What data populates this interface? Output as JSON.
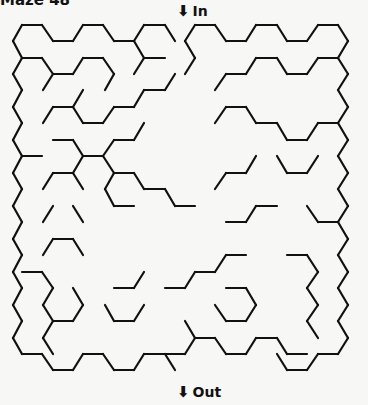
{
  "title": "Maze 48",
  "entrance": {
    "arrow": "⬇",
    "label": "In"
  },
  "exit": {
    "arrow": "⬇",
    "label": "Out"
  },
  "stroke_color": "#111111",
  "segments": [
    [
      22,
      25,
      42,
      25
    ],
    [
      42,
      25,
      53,
      41
    ],
    [
      53,
      41,
      73,
      41
    ],
    [
      73,
      41,
      83,
      25
    ],
    [
      83,
      25,
      103,
      25
    ],
    [
      103,
      25,
      114,
      41
    ],
    [
      114,
      41,
      134,
      41
    ],
    [
      134,
      41,
      144,
      25
    ],
    [
      144,
      25,
      165,
      25
    ],
    [
      165,
      25,
      175,
      41
    ],
    [
      22,
      25,
      13,
      41
    ],
    [
      13,
      41,
      22,
      58
    ],
    [
      22,
      58,
      42,
      58
    ],
    [
      42,
      58,
      53,
      74
    ],
    [
      53,
      74,
      73,
      74
    ],
    [
      73,
      74,
      83,
      58
    ],
    [
      83,
      58,
      103,
      58
    ],
    [
      103,
      58,
      114,
      74
    ],
    [
      114,
      74,
      105,
      90
    ],
    [
      53,
      74,
      43,
      90
    ],
    [
      134,
      41,
      144,
      58
    ],
    [
      144,
      58,
      165,
      58
    ],
    [
      144,
      58,
      134,
      74
    ],
    [
      22,
      58,
      13,
      74
    ],
    [
      13,
      74,
      22,
      90
    ],
    [
      22,
      90,
      13,
      107
    ],
    [
      13,
      107,
      22,
      123
    ],
    [
      22,
      123,
      13,
      140
    ],
    [
      13,
      140,
      22,
      156
    ],
    [
      22,
      156,
      13,
      173
    ],
    [
      13,
      173,
      22,
      189
    ],
    [
      22,
      189,
      13,
      206
    ],
    [
      13,
      206,
      22,
      222
    ],
    [
      22,
      222,
      13,
      239
    ],
    [
      13,
      239,
      22,
      255
    ],
    [
      22,
      255,
      13,
      272
    ],
    [
      13,
      272,
      22,
      288
    ],
    [
      22,
      288,
      13,
      305
    ],
    [
      13,
      305,
      22,
      321
    ],
    [
      22,
      321,
      13,
      338
    ],
    [
      13,
      338,
      22,
      354
    ],
    [
      22,
      354,
      42,
      354
    ],
    [
      42,
      354,
      53,
      370
    ],
    [
      53,
      370,
      73,
      370
    ],
    [
      73,
      370,
      83,
      354
    ],
    [
      83,
      354,
      103,
      354
    ],
    [
      103,
      354,
      114,
      370
    ],
    [
      114,
      370,
      134,
      370
    ],
    [
      134,
      370,
      144,
      354
    ],
    [
      144,
      354,
      165,
      354
    ],
    [
      165,
      354,
      175,
      370
    ],
    [
      53,
      107,
      73,
      107
    ],
    [
      73,
      107,
      83,
      90
    ],
    [
      73,
      107,
      83,
      123
    ],
    [
      83,
      123,
      103,
      123
    ],
    [
      103,
      123,
      114,
      107
    ],
    [
      114,
      107,
      134,
      107
    ],
    [
      134,
      107,
      144,
      90
    ],
    [
      144,
      90,
      165,
      90
    ],
    [
      165,
      90,
      175,
      74
    ],
    [
      53,
      107,
      43,
      123
    ],
    [
      22,
      156,
      42,
      156
    ],
    [
      53,
      140,
      73,
      140
    ],
    [
      73,
      140,
      83,
      156
    ],
    [
      83,
      156,
      103,
      156
    ],
    [
      103,
      156,
      114,
      140
    ],
    [
      114,
      140,
      134,
      140
    ],
    [
      134,
      140,
      144,
      123
    ],
    [
      83,
      156,
      73,
      173
    ],
    [
      73,
      173,
      53,
      173
    ],
    [
      53,
      173,
      43,
      189
    ],
    [
      73,
      173,
      83,
      189
    ],
    [
      103,
      156,
      114,
      173
    ],
    [
      114,
      173,
      134,
      173
    ],
    [
      134,
      173,
      144,
      189
    ],
    [
      144,
      189,
      165,
      189
    ],
    [
      165,
      189,
      175,
      206
    ],
    [
      175,
      206,
      195,
      206
    ],
    [
      114,
      173,
      105,
      189
    ],
    [
      105,
      189,
      114,
      206
    ],
    [
      114,
      206,
      134,
      206
    ],
    [
      53,
      206,
      43,
      222
    ],
    [
      73,
      206,
      83,
      222
    ],
    [
      53,
      239,
      73,
      239
    ],
    [
      73,
      239,
      83,
      255
    ],
    [
      53,
      239,
      43,
      255
    ],
    [
      22,
      272,
      42,
      272
    ],
    [
      42,
      272,
      53,
      288
    ],
    [
      53,
      288,
      43,
      305
    ],
    [
      43,
      305,
      53,
      321
    ],
    [
      53,
      321,
      73,
      321
    ],
    [
      73,
      321,
      83,
      305
    ],
    [
      83,
      305,
      73,
      288
    ],
    [
      53,
      321,
      43,
      338
    ],
    [
      43,
      338,
      53,
      354
    ],
    [
      114,
      321,
      134,
      321
    ],
    [
      134,
      321,
      144,
      305
    ],
    [
      114,
      321,
      105,
      305
    ],
    [
      114,
      288,
      134,
      288
    ],
    [
      134,
      288,
      144,
      272
    ],
    [
      195,
      25,
      215,
      25
    ],
    [
      215,
      25,
      226,
      41
    ],
    [
      226,
      41,
      246,
      41
    ],
    [
      246,
      41,
      256,
      25
    ],
    [
      256,
      25,
      277,
      25
    ],
    [
      277,
      25,
      287,
      41
    ],
    [
      287,
      41,
      307,
      41
    ],
    [
      307,
      41,
      318,
      25
    ],
    [
      318,
      25,
      338,
      25
    ],
    [
      338,
      25,
      348,
      41
    ],
    [
      348,
      41,
      338,
      58
    ],
    [
      195,
      25,
      185,
      41
    ],
    [
      185,
      41,
      195,
      58
    ],
    [
      195,
      58,
      185,
      74
    ],
    [
      338,
      58,
      348,
      74
    ],
    [
      348,
      74,
      338,
      90
    ],
    [
      338,
      90,
      348,
      107
    ],
    [
      348,
      107,
      338,
      123
    ],
    [
      338,
      123,
      348,
      140
    ],
    [
      348,
      140,
      338,
      156
    ],
    [
      338,
      156,
      348,
      173
    ],
    [
      348,
      173,
      338,
      189
    ],
    [
      338,
      189,
      348,
      206
    ],
    [
      348,
      206,
      338,
      222
    ],
    [
      338,
      222,
      348,
      239
    ],
    [
      348,
      239,
      338,
      255
    ],
    [
      338,
      255,
      348,
      272
    ],
    [
      348,
      272,
      338,
      288
    ],
    [
      338,
      288,
      348,
      305
    ],
    [
      348,
      305,
      338,
      321
    ],
    [
      338,
      321,
      348,
      338
    ],
    [
      348,
      338,
      338,
      354
    ],
    [
      338,
      354,
      318,
      354
    ],
    [
      318,
      354,
      307,
      370
    ],
    [
      307,
      370,
      287,
      370
    ],
    [
      287,
      370,
      277,
      354
    ],
    [
      338,
      58,
      318,
      58
    ],
    [
      318,
      58,
      307,
      74
    ],
    [
      307,
      74,
      287,
      74
    ],
    [
      287,
      74,
      277,
      58
    ],
    [
      277,
      58,
      256,
      58
    ],
    [
      256,
      58,
      246,
      74
    ],
    [
      246,
      74,
      226,
      74
    ],
    [
      226,
      74,
      215,
      90
    ],
    [
      338,
      123,
      318,
      123
    ],
    [
      318,
      123,
      307,
      140
    ],
    [
      307,
      140,
      287,
      140
    ],
    [
      287,
      140,
      277,
      123
    ],
    [
      277,
      123,
      256,
      123
    ],
    [
      256,
      123,
      246,
      107
    ],
    [
      246,
      107,
      226,
      107
    ],
    [
      226,
      107,
      215,
      123
    ],
    [
      318,
      156,
      307,
      173
    ],
    [
      307,
      173,
      287,
      173
    ],
    [
      287,
      173,
      277,
      156
    ],
    [
      256,
      156,
      246,
      173
    ],
    [
      246,
      173,
      226,
      173
    ],
    [
      226,
      173,
      215,
      189
    ],
    [
      307,
      206,
      318,
      222
    ],
    [
      318,
      222,
      338,
      222
    ],
    [
      277,
      206,
      256,
      206
    ],
    [
      256,
      206,
      246,
      222
    ],
    [
      246,
      222,
      226,
      222
    ],
    [
      287,
      255,
      307,
      255
    ],
    [
      307,
      255,
      318,
      272
    ],
    [
      318,
      272,
      307,
      288
    ],
    [
      307,
      288,
      318,
      305
    ],
    [
      318,
      305,
      307,
      321
    ],
    [
      307,
      321,
      318,
      338
    ],
    [
      246,
      255,
      226,
      255
    ],
    [
      226,
      255,
      215,
      272
    ],
    [
      215,
      272,
      195,
      272
    ],
    [
      195,
      272,
      185,
      288
    ],
    [
      185,
      288,
      165,
      288
    ],
    [
      226,
      288,
      246,
      288
    ],
    [
      246,
      288,
      256,
      305
    ],
    [
      256,
      305,
      246,
      321
    ],
    [
      246,
      321,
      226,
      321
    ],
    [
      226,
      321,
      215,
      305
    ],
    [
      185,
      321,
      195,
      338
    ],
    [
      195,
      338,
      185,
      354
    ],
    [
      185,
      354,
      165,
      354
    ],
    [
      195,
      338,
      215,
      338
    ],
    [
      215,
      338,
      226,
      354
    ],
    [
      226,
      354,
      246,
      354
    ],
    [
      246,
      354,
      256,
      338
    ],
    [
      256,
      338,
      277,
      338
    ],
    [
      277,
      338,
      287,
      354
    ],
    [
      287,
      354,
      307,
      354
    ]
  ]
}
